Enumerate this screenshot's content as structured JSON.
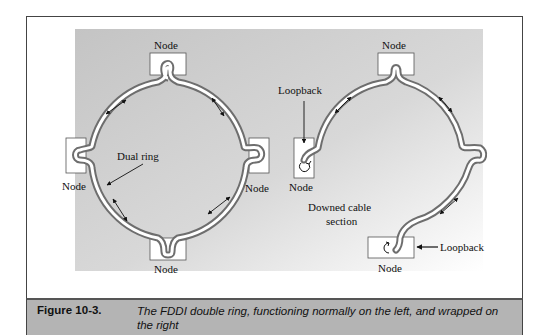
{
  "figure": {
    "left_diagram": {
      "state": "normal",
      "node_labels": [
        "Node",
        "Node",
        "Node",
        "Node"
      ],
      "ring_label": "Dual ring"
    },
    "right_diagram": {
      "state": "wrapped",
      "node_labels": [
        "Node",
        "Node",
        "Node"
      ],
      "loopback_labels": [
        "Loopback",
        "Loopback"
      ],
      "downed_label_line1": "Downed cable",
      "downed_label_line2": "section"
    },
    "caption": {
      "label": "Figure 10-3.",
      "text": "The FDDI double ring, functioning normally on the left, and wrapped on the right"
    }
  },
  "colors": {
    "ring_outline": "#6e6e6e",
    "ring_inner": "#ffffff",
    "background_gradient_from": "#c8c8c8",
    "background_gradient_to": "#ffffff",
    "caption_bar": "#b4b4b4"
  }
}
